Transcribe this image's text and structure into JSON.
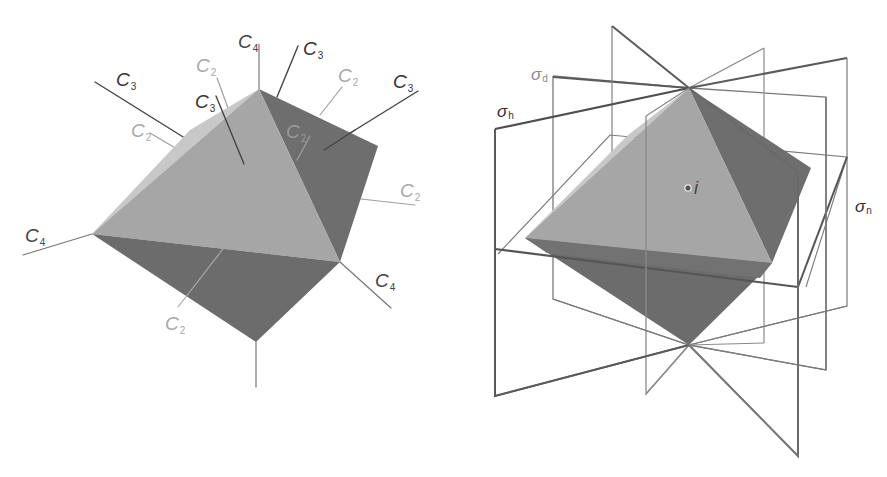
{
  "colors": {
    "face_light": "#a6a6a6",
    "face_lighter": "#c8c8c8",
    "face_dark": "#6e6e6e",
    "face_darker": "#767676",
    "axis_dark": "#444444",
    "axis_light": "#9a9a9a",
    "plane_dark": "#5a5a5a",
    "plane_light": "#8c8c8c"
  },
  "left_diagram": {
    "name": "octahedron-rotation-axes",
    "labels": [
      {
        "id": "c4-top",
        "main": "C",
        "sub": "4",
        "x": 238,
        "y": 48,
        "tone": "dark"
      },
      {
        "id": "c3-top-right",
        "main": "C",
        "sub": "3",
        "x": 303,
        "y": 55,
        "tone": "dark"
      },
      {
        "id": "c2-top-left",
        "main": "C",
        "sub": "2",
        "x": 196,
        "y": 72,
        "tone": "light"
      },
      {
        "id": "c2-top-right",
        "main": "C",
        "sub": "2",
        "x": 338,
        "y": 82,
        "tone": "light"
      },
      {
        "id": "c3-far-right",
        "main": "C",
        "sub": "3",
        "x": 393,
        "y": 88,
        "tone": "dark"
      },
      {
        "id": "c3-left",
        "main": "C",
        "sub": "3",
        "x": 116,
        "y": 86,
        "tone": "dark"
      },
      {
        "id": "c3-center",
        "main": "C",
        "sub": "3",
        "x": 195,
        "y": 108,
        "tone": "dark"
      },
      {
        "id": "c2-left",
        "main": "C",
        "sub": "2",
        "x": 131,
        "y": 137,
        "tone": "light"
      },
      {
        "id": "c2-inner",
        "main": "C",
        "sub": "2",
        "x": 286,
        "y": 138,
        "tone": "light"
      },
      {
        "id": "c2-right",
        "main": "C",
        "sub": "2",
        "x": 400,
        "y": 197,
        "tone": "light"
      },
      {
        "id": "c4-left",
        "main": "C",
        "sub": "4",
        "x": 25,
        "y": 242,
        "tone": "dark"
      },
      {
        "id": "c4-right",
        "main": "C",
        "sub": "4",
        "x": 375,
        "y": 287,
        "tone": "dark"
      },
      {
        "id": "c2-bottom",
        "main": "C",
        "sub": "2",
        "x": 165,
        "y": 330,
        "tone": "light"
      }
    ]
  },
  "right_diagram": {
    "name": "octahedron-symmetry-planes",
    "labels": [
      {
        "id": "sigma-d",
        "main": "σ",
        "sub": "d",
        "x": 531,
        "y": 80
      },
      {
        "id": "sigma-h",
        "main": "σ",
        "sub": "h",
        "x": 497,
        "y": 117
      },
      {
        "id": "sigma-n",
        "main": "σ",
        "sub": "n",
        "x": 855,
        "y": 212
      }
    ],
    "inversion_center": {
      "label": "i",
      "x": 688,
      "y": 188
    }
  }
}
